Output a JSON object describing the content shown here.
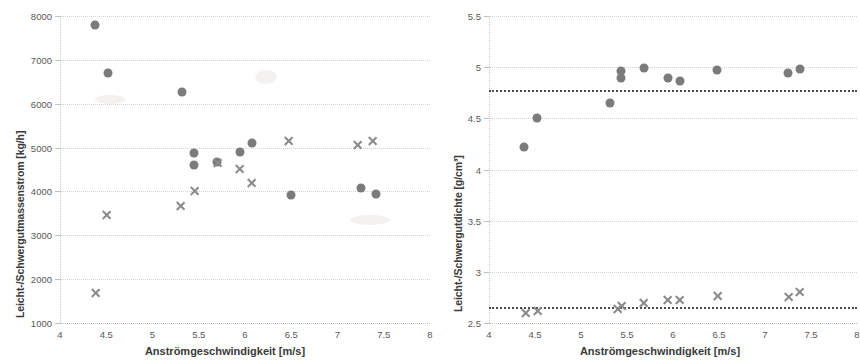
{
  "figure": {
    "panels": [
      {
        "id": "left",
        "ylabel": "Leicht-/Schwergutmassenstrom [kg/h]",
        "xlabel": "Anströmgeschwindigkeit [m/s]"
      },
      {
        "id": "right",
        "ylabel": "Leicht-/Schwergutdichte [g/cm³]",
        "xlabel": "Anströmgeschwindigkeit [m/s]"
      }
    ]
  },
  "chart_data": [
    {
      "type": "scatter",
      "title": "",
      "xlabel": "Anströmgeschwindigkeit [m/s]",
      "ylabel": "Leicht-/Schwergutmassenstrom [kg/h]",
      "xlim": [
        4,
        8
      ],
      "ylim": [
        1000,
        8000
      ],
      "xticks": [
        4,
        4.5,
        5,
        5.5,
        6,
        6.5,
        7,
        7.5,
        8
      ],
      "xticklabels": [
        "4",
        "4.5",
        "5",
        "5.5",
        "6",
        "6.5",
        "7",
        "7.5",
        "8"
      ],
      "yticks": [
        1000,
        2000,
        3000,
        4000,
        5000,
        6000,
        7000,
        8000
      ],
      "yticklabels": [
        "1000",
        "2000",
        "3000",
        "4000",
        "5000",
        "6000",
        "7000",
        "8000"
      ],
      "grid": true,
      "legend": "none",
      "series": [
        {
          "name": "Leichtgutmassenstrom",
          "marker": "circle",
          "color": "#7b7b7b",
          "points": [
            {
              "x": 4.38,
              "y": 7790
            },
            {
              "x": 4.52,
              "y": 6690
            },
            {
              "x": 5.32,
              "y": 6260
            },
            {
              "x": 5.45,
              "y": 4870
            },
            {
              "x": 5.45,
              "y": 4600
            },
            {
              "x": 5.7,
              "y": 4670
            },
            {
              "x": 5.95,
              "y": 4890
            },
            {
              "x": 6.08,
              "y": 5110
            },
            {
              "x": 6.5,
              "y": 3920
            },
            {
              "x": 7.25,
              "y": 4080
            },
            {
              "x": 7.42,
              "y": 3940
            }
          ]
        },
        {
          "name": "Schwergutmassenstrom",
          "marker": "cross",
          "color": "#8a8a8a",
          "points": [
            {
              "x": 4.38,
              "y": 1690
            },
            {
              "x": 4.5,
              "y": 3470
            },
            {
              "x": 5.3,
              "y": 3670
            },
            {
              "x": 5.45,
              "y": 4000
            },
            {
              "x": 5.7,
              "y": 4640
            },
            {
              "x": 5.94,
              "y": 4520
            },
            {
              "x": 6.07,
              "y": 4190
            },
            {
              "x": 6.47,
              "y": 5140
            },
            {
              "x": 7.22,
              "y": 5060
            },
            {
              "x": 7.38,
              "y": 5140
            }
          ]
        }
      ]
    },
    {
      "type": "scatter",
      "title": "",
      "xlabel": "Anströmgeschwindigkeit [m/s]",
      "ylabel": "Leicht-/Schwergutdichte [g/cm³]",
      "xlim": [
        4,
        8
      ],
      "ylim": [
        2.5,
        5.5
      ],
      "xticks": [
        4,
        4.5,
        5,
        5.5,
        6,
        6.5,
        7,
        7.5,
        8
      ],
      "xticklabels": [
        "4",
        "4.5",
        "5",
        "5.5",
        "6",
        "6.5",
        "7",
        "7.5",
        "8"
      ],
      "yticks": [
        2.5,
        3,
        3.5,
        4,
        4.5,
        5,
        5.5
      ],
      "yticklabels": [
        "2.5",
        "3",
        "3.5",
        "4",
        "4.5",
        "5",
        "5.5"
      ],
      "grid": true,
      "legend": "none",
      "reference_lines": [
        {
          "value": 4.78,
          "style": "dotted",
          "color": "#4a4a4a"
        },
        {
          "value": 2.66,
          "style": "dotted",
          "color": "#4a4a4a"
        }
      ],
      "series": [
        {
          "name": "Leichtgutdichte",
          "marker": "circle",
          "color": "#7b7b7b",
          "points": [
            {
              "x": 4.38,
              "y": 4.22
            },
            {
              "x": 4.52,
              "y": 4.5
            },
            {
              "x": 5.32,
              "y": 4.65
            },
            {
              "x": 5.44,
              "y": 4.96
            },
            {
              "x": 5.44,
              "y": 4.89
            },
            {
              "x": 5.68,
              "y": 4.99
            },
            {
              "x": 5.95,
              "y": 4.89
            },
            {
              "x": 6.08,
              "y": 4.86
            },
            {
              "x": 6.48,
              "y": 4.97
            },
            {
              "x": 7.25,
              "y": 4.94
            },
            {
              "x": 7.38,
              "y": 4.98
            }
          ]
        },
        {
          "name": "Schwergutdichte",
          "marker": "cross",
          "color": "#8a8a8a",
          "points": [
            {
              "x": 4.4,
              "y": 2.6
            },
            {
              "x": 4.53,
              "y": 2.62
            },
            {
              "x": 5.4,
              "y": 2.64
            },
            {
              "x": 5.44,
              "y": 2.67
            },
            {
              "x": 5.68,
              "y": 2.7
            },
            {
              "x": 5.94,
              "y": 2.72
            },
            {
              "x": 6.07,
              "y": 2.72
            },
            {
              "x": 6.48,
              "y": 2.76
            },
            {
              "x": 7.25,
              "y": 2.75
            },
            {
              "x": 7.38,
              "y": 2.8
            }
          ]
        }
      ]
    }
  ]
}
